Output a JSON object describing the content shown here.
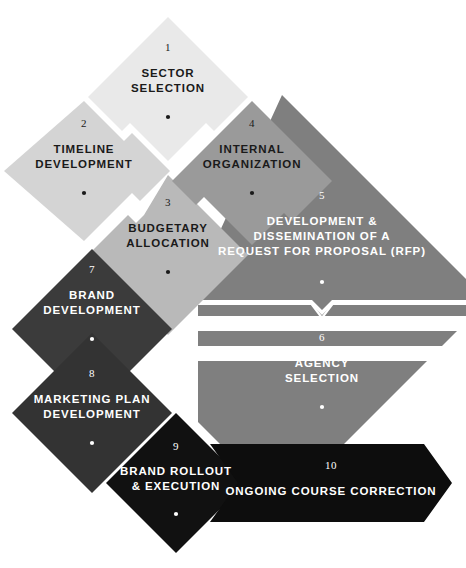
{
  "diagram": {
    "background_color": "#ffffff",
    "steps": [
      {
        "number": "1",
        "label_lines": [
          "SECTOR",
          "SELECTION"
        ],
        "fill": "#e9e9e9",
        "text_color": "#1a1a1a",
        "dot_color": "#1a1a1a",
        "shape": "diamond"
      },
      {
        "number": "2",
        "label_lines": [
          "TIMELINE",
          "DEVELOPMENT"
        ],
        "fill": "#d4d4d4",
        "text_color": "#1a1a1a",
        "dot_color": "#1a1a1a",
        "shape": "diamond"
      },
      {
        "number": "3",
        "label_lines": [
          "BUDGETARY",
          "ALLOCATION"
        ],
        "fill": "#b9b9b9",
        "text_color": "#1a1a1a",
        "dot_color": "#1a1a1a",
        "shape": "diamond"
      },
      {
        "number": "4",
        "label_lines": [
          "INTERNAL",
          "ORGANIZATION"
        ],
        "fill": "#9a9a9a",
        "text_color": "#1a1a1a",
        "dot_color": "#1a1a1a",
        "shape": "diamond"
      },
      {
        "number": "5",
        "label_lines": [
          "DEVELOPMENT &",
          "DISSEMINATION OF A",
          "REQUEST FOR PROPOSAL (RFP)"
        ],
        "fill": "#7f7f7f",
        "text_color": "#ffffff",
        "dot_color": "#ffffff",
        "shape": "diamond-upper-half"
      },
      {
        "number": "6",
        "label_lines": [
          "AGENCY",
          "SELECTION"
        ],
        "fill": "#7f7f7f",
        "text_color": "#ffffff",
        "dot_color": "#ffffff",
        "shape": "diamond-lower-half"
      },
      {
        "number": "7",
        "label_lines": [
          "BRAND",
          "DEVELOPMENT"
        ],
        "fill": "#3b3b3b",
        "text_color": "#ffffff",
        "dot_color": "#ffffff",
        "shape": "diamond"
      },
      {
        "number": "8",
        "label_lines": [
          "MARKETING PLAN",
          "DEVELOPMENT"
        ],
        "fill": "#333333",
        "text_color": "#ffffff",
        "dot_color": "#ffffff",
        "shape": "diamond"
      },
      {
        "number": "9",
        "label_lines": [
          "BRAND ROLLOUT",
          "& EXECUTION"
        ],
        "fill": "#111111",
        "text_color": "#ffffff",
        "dot_color": "#ffffff",
        "shape": "diamond"
      },
      {
        "number": "10",
        "label_lines": [
          "ONGOING COURSE CORRECTION"
        ],
        "fill": "#0d0d0d",
        "text_color": "#ffffff",
        "dot_color": "none",
        "shape": "right-arrow-banner"
      }
    ],
    "connectors": [
      {
        "name": "feedback-arrow",
        "direction": "left",
        "fill": "#ffffff",
        "description": "white left-pointing arrow cut out of step 5/6 block pointing back toward steps 7 and 8"
      },
      {
        "name": "divider-line",
        "direction": "horizontal",
        "color": "#ffffff",
        "description": "white notched divider between step 5 and step 6"
      }
    ]
  }
}
